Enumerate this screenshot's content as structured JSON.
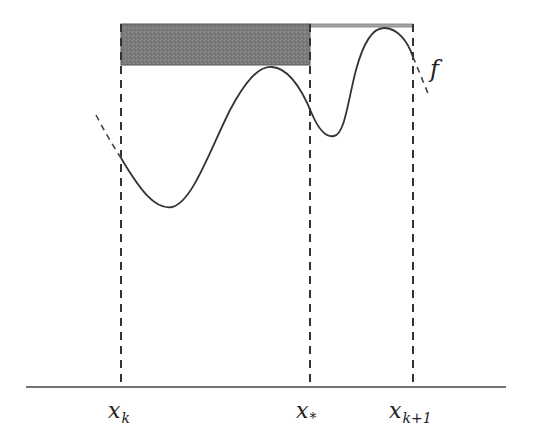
{
  "diagram": {
    "function_label": "f",
    "points": [
      {
        "id": "xk",
        "base": "x",
        "sub": "k",
        "x": 121
      },
      {
        "id": "xstar",
        "base": "x",
        "sub": "*",
        "x": 310
      },
      {
        "id": "xk1",
        "base": "x",
        "sub": "k+1",
        "x": 413
      }
    ],
    "shaded_region": {
      "from": "x_k",
      "to": "x_*",
      "color": "#7a7a7a"
    },
    "thin_strip": {
      "from": "x_*",
      "to": "x_{k+1}",
      "color": "#9a9a9a"
    },
    "colors": {
      "curve": "#333333",
      "axis": "#444444",
      "dashed": "#333333"
    }
  }
}
